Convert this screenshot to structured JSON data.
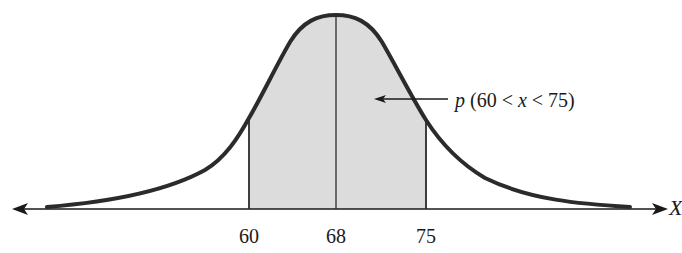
{
  "diagram": {
    "type": "normal-distribution-shaded-area",
    "annotation": {
      "prob_symbol": "p",
      "open": " (60 < ",
      "var": "x",
      "close": " < 75)",
      "full_text": "p (60 < x < 75)"
    },
    "axis_variable": "X",
    "ticks": [
      {
        "value": "60",
        "x": 249
      },
      {
        "value": "68",
        "x": 336
      },
      {
        "value": "75",
        "x": 426
      }
    ],
    "mean": "68",
    "shaded_interval": {
      "lower": "60",
      "upper": "75"
    },
    "colors": {
      "curve": "#2b2b2b",
      "shade": "#dcdcdc",
      "axis": "#1a1a1a",
      "background": "#ffffff"
    }
  }
}
